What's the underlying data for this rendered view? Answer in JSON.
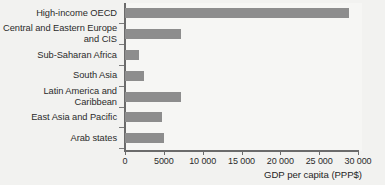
{
  "chart_data": {
    "type": "bar",
    "orientation": "horizontal",
    "title": "",
    "xlabel": "GDP per capita (PPP$)",
    "ylabel": "",
    "xlim": [
      0,
      30000
    ],
    "grid": false,
    "legend": null,
    "categories": [
      "High-income OECD",
      "Central and Eastern Europe\nand CIS",
      "Sub-Saharan Africa",
      "South Asia",
      "Latin America and\nCaribbean",
      "East Asia and Pacific",
      "Arab states"
    ],
    "values": [
      28800,
      7200,
      1750,
      2500,
      7250,
      4800,
      5050
    ],
    "xticks": [
      0,
      5000,
      10000,
      15000,
      20000,
      25000,
      30000
    ],
    "xtick_labels": [
      "0",
      "5000",
      "10 000",
      "15 000",
      "20 000",
      "25 000",
      "30 000"
    ],
    "bar_color": "#8d8d8d",
    "axis_color": "#6b6b6b",
    "background_color": "#f2f2f0",
    "plot_background_color": "#f6f6f4",
    "text_color": "#2b2b2b"
  }
}
